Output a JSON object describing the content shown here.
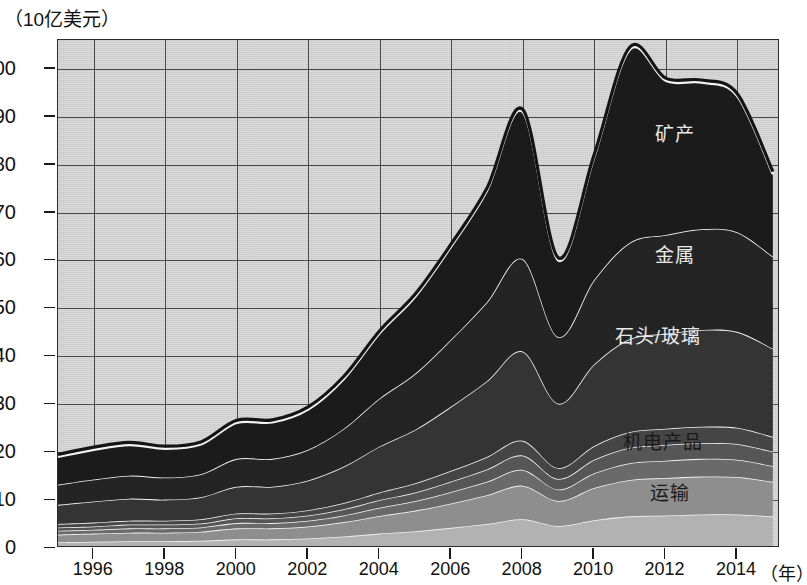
{
  "axes": {
    "y_unit_label": "（10亿美元）",
    "x_unit_label": "（年）",
    "y_ticks": [
      0,
      10,
      20,
      30,
      40,
      50,
      60,
      70,
      80,
      90,
      100
    ],
    "x_ticks": [
      1996,
      1998,
      2000,
      2002,
      2004,
      2006,
      2008,
      2010,
      2012,
      2014
    ]
  },
  "series_labels": {
    "minerals": "矿产",
    "metals": "金属",
    "stone_glass": "石头/玻璃",
    "machinery": "机电产品",
    "transport": "运输"
  },
  "colors": {
    "plot_background": "#d6d6d6",
    "grid": "#4a4a4a",
    "frame": "#2b2b2b",
    "band_separator": "#f2f2f2",
    "minerals": "#1b1b1b",
    "metals": "#242424",
    "stone_glass": "#343434",
    "band_4": "#454545",
    "band_5": "#565656",
    "band_6": "#6a6a6a",
    "machinery": "#8e8e8e",
    "transport": "#b2b2b2",
    "bottom_band": "#d2d2d2"
  },
  "chart_data": {
    "type": "area",
    "title": "",
    "subtitle": "",
    "xlabel": "（年）",
    "ylabel": "（10亿美元）",
    "xlim": [
      1995,
      2015.2
    ],
    "ylim": [
      0,
      106
    ],
    "grid": true,
    "legend": "inline-labels",
    "stacked": true,
    "x": [
      1995,
      1996,
      1997,
      1998,
      1999,
      2000,
      2001,
      2002,
      2003,
      2004,
      2005,
      2006,
      2007,
      2008,
      2009,
      2010,
      2011,
      2012,
      2013,
      2014,
      2015
    ],
    "series": [
      {
        "name": "运输",
        "values": [
          1.2,
          1.3,
          1.4,
          1.4,
          1.5,
          1.8,
          1.8,
          2.0,
          2.4,
          3.0,
          3.5,
          4.2,
          5.0,
          6.0,
          4.6,
          5.8,
          6.6,
          6.8,
          7.0,
          7.0,
          6.6
        ]
      },
      {
        "name": "机电产品",
        "values": [
          1.6,
          1.7,
          1.8,
          1.8,
          1.9,
          2.3,
          2.3,
          2.5,
          3.0,
          3.7,
          4.3,
          5.1,
          6.0,
          7.0,
          5.2,
          6.7,
          7.6,
          7.8,
          7.9,
          7.8,
          7.2
        ]
      },
      {
        "name": "band_6",
        "values": [
          0.8,
          0.8,
          0.9,
          0.9,
          0.9,
          1.1,
          1.1,
          1.2,
          1.4,
          1.7,
          2.0,
          2.4,
          2.8,
          3.3,
          2.4,
          3.1,
          3.5,
          3.6,
          3.7,
          3.6,
          3.3
        ]
      },
      {
        "name": "band_5",
        "values": [
          0.7,
          0.7,
          0.8,
          0.8,
          0.8,
          1.0,
          1.0,
          1.1,
          1.3,
          1.6,
          1.8,
          2.2,
          2.6,
          3.0,
          2.2,
          2.8,
          3.2,
          3.3,
          3.3,
          3.3,
          3.0
        ]
      },
      {
        "name": "band_4",
        "values": [
          0.7,
          0.8,
          0.8,
          0.8,
          0.9,
          1.0,
          1.0,
          1.1,
          1.3,
          1.6,
          1.9,
          2.2,
          2.6,
          3.1,
          2.3,
          2.9,
          3.3,
          3.4,
          3.4,
          3.4,
          3.1
        ]
      },
      {
        "name": "石头/玻璃",
        "values": [
          4.0,
          4.4,
          4.6,
          4.4,
          4.6,
          5.6,
          5.6,
          6.2,
          7.6,
          9.6,
          11.2,
          13.4,
          15.8,
          18.6,
          13.4,
          17.0,
          19.4,
          19.8,
          20.2,
          20.0,
          18.4
        ]
      },
      {
        "name": "金属",
        "values": [
          4.2,
          4.6,
          4.8,
          4.6,
          4.8,
          5.8,
          5.8,
          6.4,
          7.9,
          10.0,
          11.7,
          14.0,
          16.5,
          19.3,
          13.9,
          17.6,
          20.1,
          20.6,
          21.0,
          20.8,
          19.2
        ]
      },
      {
        "name": "矿产",
        "values": [
          5.8,
          6.2,
          6.4,
          6.0,
          6.2,
          7.5,
          7.6,
          8.4,
          10.4,
          13.6,
          16.1,
          19.4,
          23.2,
          30.7,
          16.0,
          25.6,
          40.3,
          32.2,
          30.6,
          28.4,
          17.2
        ]
      }
    ],
    "totals": [
      19.0,
      20.5,
      21.5,
      20.7,
      21.6,
      26.1,
      26.2,
      28.9,
      35.3,
      44.8,
      52.5,
      62.9,
      74.5,
      91.0,
      60.0,
      81.5,
      104.0,
      97.5,
      97.1,
      94.3,
      78.0
    ],
    "notes": {
      "peak_2008": 91,
      "trough_2009": 60,
      "peak_2011": 104,
      "end_2015": 78
    }
  }
}
